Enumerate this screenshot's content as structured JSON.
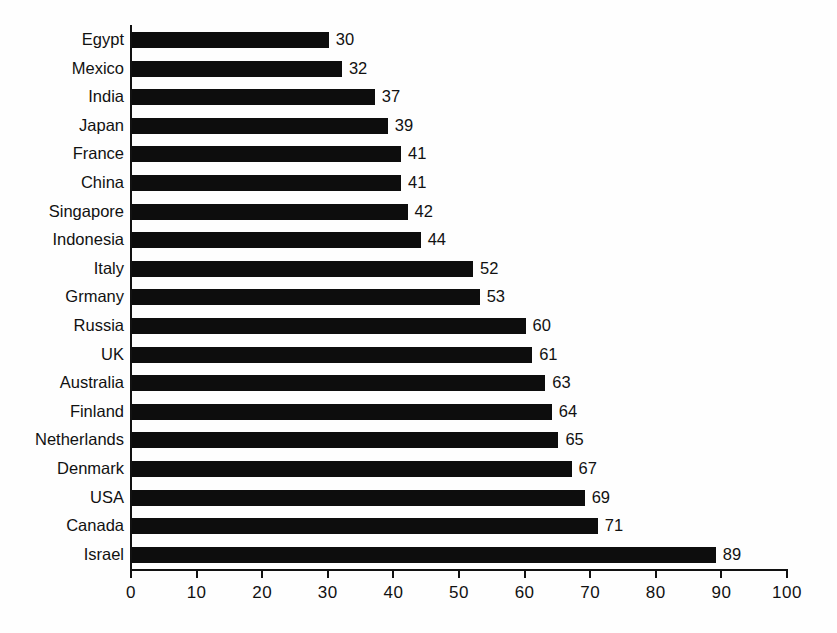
{
  "chart_data": {
    "type": "bar",
    "orientation": "horizontal",
    "title": "",
    "subtitle": "",
    "xlabel": "",
    "ylabel": "",
    "xlim": [
      0,
      100
    ],
    "xticks": [
      0,
      10,
      20,
      30,
      40,
      50,
      60,
      70,
      80,
      90,
      100
    ],
    "xtick_labels": [
      "0",
      "10",
      "20",
      "30",
      "40",
      "50",
      "60",
      "70",
      "80",
      "90",
      "100"
    ],
    "grid": false,
    "legend": false,
    "bar_color": "#0d0d0d",
    "data_labels": true,
    "categories": [
      "Egypt",
      "Mexico",
      "India",
      "Japan",
      "France",
      "China",
      "Singapore",
      "Indonesia",
      "Italy",
      "Grmany",
      "Russia",
      "UK",
      "Australia",
      "Finland",
      "Netherlands",
      "Denmark",
      "USA",
      "Canada",
      "Israel"
    ],
    "values": [
      30,
      32,
      37,
      39,
      41,
      41,
      42,
      44,
      52,
      53,
      60,
      61,
      63,
      64,
      65,
      67,
      69,
      71,
      89
    ],
    "value_labels": [
      "30",
      "32",
      "37",
      "39",
      "41",
      "41",
      "42",
      "44",
      "52",
      "53",
      "60",
      "61",
      "63",
      "64",
      "65",
      "67",
      "69",
      "71",
      "89"
    ]
  }
}
